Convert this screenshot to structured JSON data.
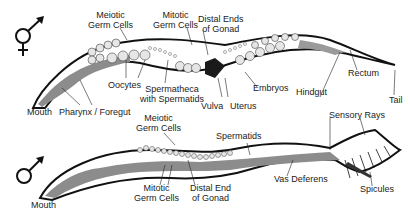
{
  "diagram": {
    "hermaphrodite": {
      "symbol": "hermaphrodite-symbol",
      "labels": {
        "meiotic_germ_cells": "Meiotic\nGerm Cells",
        "mitotic_germ_cells": "Mitotic\nGerm Cells",
        "distal_ends": "Distal Ends\nof Gonad",
        "oocytes": "Oocytes",
        "spermatheca": "Spermatheca\nwith Spermatids",
        "vulva": "Vulva",
        "uterus": "Uterus",
        "embryos": "Embryos",
        "rectum": "Rectum",
        "hindgut": "Hindgut",
        "tail": "Tail",
        "mouth": "Mouth",
        "pharynx": "Pharynx / Foregut"
      }
    },
    "male": {
      "symbol": "male-symbol",
      "labels": {
        "meiotic_germ_cells": "Meiotic\nGerm Cells",
        "spermatids": "Spermatids",
        "sensory_rays": "Sensory Rays",
        "vas_deferens": "Vas Deferens",
        "spicules": "Spicules",
        "mitotic_germ_cells": "Mitotic\nGerm Cells",
        "distal_end": "Distal End\nof Gonad",
        "mouth": "Mouth"
      }
    },
    "colors": {
      "outline": "#111111",
      "gut": "#8c8c8c",
      "cells": "#e6e6e6",
      "dark": "#1a1a1a"
    }
  }
}
